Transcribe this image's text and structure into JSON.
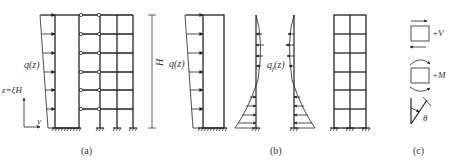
{
  "figure": {
    "panels": [
      {
        "id": "a",
        "caption": "(a)"
      },
      {
        "id": "b",
        "caption": "(b)"
      },
      {
        "id": "c",
        "caption": "(c)"
      }
    ],
    "labels": {
      "load_a": "q(z)",
      "height_coord": "z=ξH",
      "axis_y": "y",
      "height_dim": "H",
      "load_b": "q(z)",
      "interaction_load": "q",
      "interaction_sub": "f",
      "interaction_arg": "(z)",
      "shear_sign": "+V",
      "moment_sign": "+M",
      "rotation": "θ"
    },
    "colors": {
      "line": "#222222",
      "text": "#333333"
    }
  }
}
